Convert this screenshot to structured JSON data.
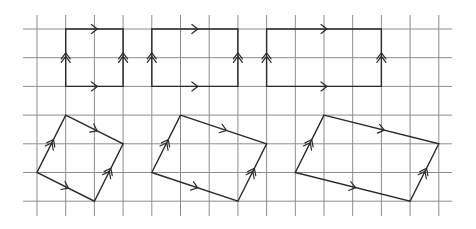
{
  "diagram": {
    "title": "",
    "grid": {
      "origin_x": 37,
      "origin_y": 29,
      "step": 28.7,
      "columns": 15,
      "rows": 7,
      "h_line_x_start": 23,
      "h_line_x_end": 452,
      "v_line_y_start": 15,
      "v_line_y_end": 216,
      "color": "#8c8c8c"
    },
    "stroke_color": "#2a2a2a",
    "shapes": [
      {
        "name": "rectangle-1x2",
        "kind": "rectangle",
        "vertices_grid": [
          [
            1,
            0
          ],
          [
            3,
            0
          ],
          [
            3,
            2
          ],
          [
            1,
            2
          ]
        ],
        "marks": [
          {
            "edge": [
              [
                1,
                0
              ],
              [
                3,
                0
              ]
            ],
            "count": 1
          },
          {
            "edge": [
              [
                1,
                2
              ],
              [
                3,
                2
              ]
            ],
            "count": 1
          },
          {
            "edge": [
              [
                1,
                2
              ],
              [
                1,
                0
              ]
            ],
            "count": 2
          },
          {
            "edge": [
              [
                3,
                2
              ],
              [
                3,
                0
              ]
            ],
            "count": 2
          }
        ]
      },
      {
        "name": "rectangle-3x2",
        "kind": "rectangle",
        "vertices_grid": [
          [
            4,
            0
          ],
          [
            7,
            0
          ],
          [
            7,
            2
          ],
          [
            4,
            2
          ]
        ],
        "marks": [
          {
            "edge": [
              [
                4,
                0
              ],
              [
                7,
                0
              ]
            ],
            "count": 1
          },
          {
            "edge": [
              [
                4,
                2
              ],
              [
                7,
                2
              ]
            ],
            "count": 1
          },
          {
            "edge": [
              [
                4,
                2
              ],
              [
                4,
                0
              ]
            ],
            "count": 2
          },
          {
            "edge": [
              [
                7,
                2
              ],
              [
                7,
                0
              ]
            ],
            "count": 2
          }
        ]
      },
      {
        "name": "rectangle-4x2",
        "kind": "rectangle",
        "vertices_grid": [
          [
            8,
            0
          ],
          [
            12,
            0
          ],
          [
            12,
            2
          ],
          [
            8,
            2
          ]
        ],
        "marks": [
          {
            "edge": [
              [
                8,
                0
              ],
              [
                12,
                0
              ]
            ],
            "count": 1
          },
          {
            "edge": [
              [
                8,
                2
              ],
              [
                12,
                2
              ]
            ],
            "count": 1
          },
          {
            "edge": [
              [
                8,
                2
              ],
              [
                8,
                0
              ]
            ],
            "count": 2
          },
          {
            "edge": [
              [
                12,
                2
              ],
              [
                12,
                0
              ]
            ],
            "count": 2
          }
        ]
      },
      {
        "name": "parallelogram-small",
        "kind": "parallelogram",
        "vertices_grid": [
          [
            1,
            3
          ],
          [
            3,
            4
          ],
          [
            2,
            6
          ],
          [
            0,
            5
          ]
        ],
        "marks": [
          {
            "edge": [
              [
                1,
                3
              ],
              [
                3,
                4
              ]
            ],
            "count": 1
          },
          {
            "edge": [
              [
                0,
                5
              ],
              [
                2,
                6
              ]
            ],
            "count": 1
          },
          {
            "edge": [
              [
                0,
                5
              ],
              [
                1,
                3
              ]
            ],
            "count": 2
          },
          {
            "edge": [
              [
                2,
                6
              ],
              [
                3,
                4
              ]
            ],
            "count": 2
          }
        ]
      },
      {
        "name": "parallelogram-medium",
        "kind": "parallelogram",
        "vertices_grid": [
          [
            5,
            3
          ],
          [
            8,
            4
          ],
          [
            7,
            6
          ],
          [
            4,
            5
          ]
        ],
        "marks": [
          {
            "edge": [
              [
                5,
                3
              ],
              [
                8,
                4
              ]
            ],
            "count": 1
          },
          {
            "edge": [
              [
                4,
                5
              ],
              [
                7,
                6
              ]
            ],
            "count": 1
          },
          {
            "edge": [
              [
                4,
                5
              ],
              [
                5,
                3
              ]
            ],
            "count": 2
          },
          {
            "edge": [
              [
                7,
                6
              ],
              [
                8,
                4
              ]
            ],
            "count": 2
          }
        ]
      },
      {
        "name": "parallelogram-large",
        "kind": "parallelogram",
        "vertices_grid": [
          [
            10,
            3
          ],
          [
            14,
            4
          ],
          [
            13,
            6
          ],
          [
            9,
            5
          ]
        ],
        "marks": [
          {
            "edge": [
              [
                10,
                3
              ],
              [
                14,
                4
              ]
            ],
            "count": 1
          },
          {
            "edge": [
              [
                9,
                5
              ],
              [
                13,
                6
              ]
            ],
            "count": 1
          },
          {
            "edge": [
              [
                9,
                5
              ],
              [
                10,
                3
              ]
            ],
            "count": 2
          },
          {
            "edge": [
              [
                13,
                6
              ],
              [
                14,
                4
              ]
            ],
            "count": 2
          }
        ]
      }
    ]
  }
}
